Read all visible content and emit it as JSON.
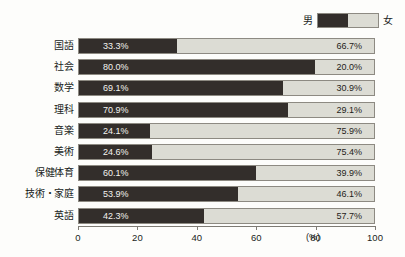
{
  "legend": {
    "male_label": "男",
    "female_label": "女"
  },
  "axis": {
    "unit": "(%)",
    "ticks": [
      "0",
      "20",
      "40",
      "60",
      "80",
      "100"
    ]
  },
  "chart_data": {
    "type": "bar",
    "orientation": "horizontal",
    "stacked": true,
    "normalized_to_percent": true,
    "title": "",
    "subtitle": "",
    "xlabel": "(%)",
    "ylabel": "",
    "xlim": [
      0,
      100
    ],
    "xticks": [
      0,
      20,
      40,
      60,
      80,
      100
    ],
    "grid": false,
    "legend_position": "top-right",
    "categories": [
      "国語",
      "社会",
      "数学",
      "理科",
      "音楽",
      "美術",
      "保健体育",
      "技術・家庭",
      "英語"
    ],
    "series": [
      {
        "name": "男",
        "color": "#332e2b",
        "values": [
          33.3,
          80.0,
          69.1,
          70.9,
          24.1,
          24.6,
          60.1,
          53.9,
          42.3
        ],
        "labels": [
          "33.3%",
          "80.0%",
          "69.1%",
          "70.9%",
          "24.1%",
          "24.6%",
          "60.1%",
          "53.9%",
          "42.3%"
        ]
      },
      {
        "name": "女",
        "color": "#dcdcd4",
        "values": [
          66.7,
          20.0,
          30.9,
          29.1,
          75.9,
          75.4,
          39.9,
          46.1,
          57.7
        ],
        "labels": [
          "66.7%",
          "20.0%",
          "30.9%",
          "29.1%",
          "75.9%",
          "75.4%",
          "39.9%",
          "46.1%",
          "57.7%"
        ]
      }
    ]
  }
}
